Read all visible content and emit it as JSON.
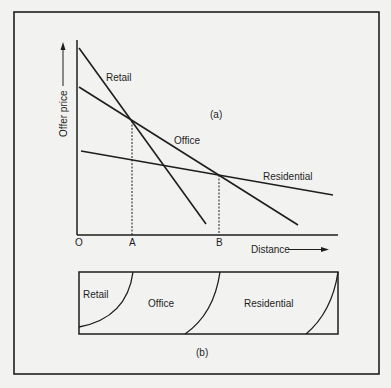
{
  "figure": {
    "panel_a": {
      "label": "(a)",
      "y_axis_label": "Offer price",
      "x_axis_label": "Distance",
      "origin_label": "O",
      "points": {
        "a_label": "A",
        "b_label": "B"
      },
      "curves": [
        {
          "name": "Retail",
          "label": "Retail",
          "from": [
            79,
            48
          ],
          "to": [
            206,
            224
          ]
        },
        {
          "name": "Office",
          "label": "Office",
          "from": [
            79,
            87
          ],
          "to": [
            298,
            225
          ]
        },
        {
          "name": "Residential",
          "label": "Residential",
          "from": [
            81,
            151
          ],
          "to": [
            333,
            195
          ]
        }
      ]
    },
    "panel_b": {
      "label": "(b)",
      "zones": [
        {
          "label": "Retail"
        },
        {
          "label": "Office"
        },
        {
          "label": "Residential"
        }
      ]
    },
    "colors": {
      "background": "#f2f2f0",
      "ink": "#1e1e1e"
    }
  }
}
